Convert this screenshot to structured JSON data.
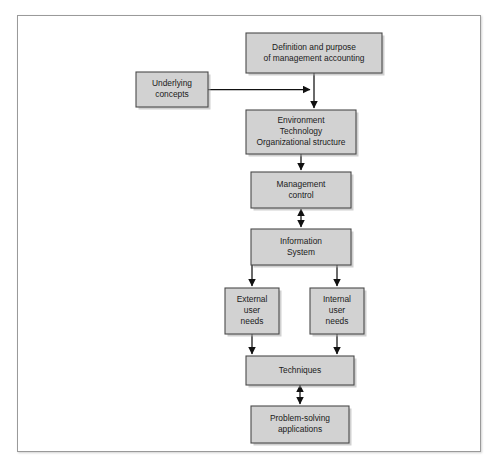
{
  "figure": {
    "background_color": "#ffffff",
    "frame_border_color": "#9a9a9a",
    "box_fill_color": "#d2d2d2",
    "box_border_color": "#4a4a4a",
    "connector_color": "#111111"
  },
  "nodes": [
    {
      "id": "definition",
      "lines": [
        "Definition and purpose",
        "of management accounting"
      ],
      "x": 228,
      "y": 17,
      "width": 136,
      "height": 40
    },
    {
      "id": "underlying",
      "lines": [
        "Underlying",
        "concepts"
      ],
      "x": 118,
      "y": 56,
      "width": 72,
      "height": 35
    },
    {
      "id": "environment",
      "lines": [
        "Environment",
        "Technology",
        "Organizational structure"
      ],
      "x": 228,
      "y": 94,
      "width": 110,
      "height": 44
    },
    {
      "id": "management-control",
      "lines": [
        "Management",
        "control"
      ],
      "x": 233,
      "y": 156,
      "width": 100,
      "height": 36
    },
    {
      "id": "information-system",
      "lines": [
        "Information",
        "System"
      ],
      "x": 233,
      "y": 213,
      "width": 100,
      "height": 36
    },
    {
      "id": "external-user-needs",
      "lines": [
        "External",
        "user",
        "needs"
      ],
      "x": 207,
      "y": 272,
      "width": 54,
      "height": 46
    },
    {
      "id": "internal-user-needs",
      "lines": [
        "Internal",
        "user",
        "needs"
      ],
      "x": 292,
      "y": 272,
      "width": 54,
      "height": 46
    },
    {
      "id": "techniques",
      "lines": [
        "Techniques"
      ],
      "x": 228,
      "y": 340,
      "width": 108,
      "height": 29
    },
    {
      "id": "problem-solving",
      "lines": [
        "Problem-solving",
        "applications"
      ],
      "x": 233,
      "y": 390,
      "width": 98,
      "height": 37
    }
  ],
  "connectors": [
    {
      "id": "definition-to-environment",
      "from": "definition",
      "to": "environment",
      "path": "M 296 57 L 296 92",
      "arrow_start": false,
      "arrow_end": true
    },
    {
      "id": "underlying-to-trunk",
      "from": "underlying",
      "to": "definition-environment-trunk",
      "path": "M 190 73.5 L 292 73.5",
      "arrow_start": false,
      "arrow_end": true
    },
    {
      "id": "environment-to-management-control",
      "from": "environment",
      "to": "management-control",
      "path": "M 283 138 L 283 154",
      "arrow_start": false,
      "arrow_end": true
    },
    {
      "id": "management-control-to-information-system",
      "from": "management-control",
      "to": "information-system",
      "path": "M 283 193 L 283 211",
      "arrow_start": true,
      "arrow_end": true
    },
    {
      "id": "information-system-to-external",
      "from": "information-system",
      "to": "external-user-needs",
      "path": "M 234 249 L 234 270",
      "arrow_start": false,
      "arrow_end": true
    },
    {
      "id": "information-system-to-internal",
      "from": "information-system",
      "to": "internal-user-needs",
      "path": "M 319 249 L 319 270",
      "arrow_start": false,
      "arrow_end": true
    },
    {
      "id": "external-to-techniques",
      "from": "external-user-needs",
      "to": "techniques",
      "path": "M 234 318 L 234 338",
      "arrow_start": false,
      "arrow_end": true
    },
    {
      "id": "internal-to-techniques",
      "from": "internal-user-needs",
      "to": "techniques",
      "path": "M 319 318 L 319 338",
      "arrow_start": false,
      "arrow_end": true
    },
    {
      "id": "techniques-to-problem-solving",
      "from": "techniques",
      "to": "problem-solving",
      "path": "M 282 369 L 282 388",
      "arrow_start": true,
      "arrow_end": true
    }
  ]
}
